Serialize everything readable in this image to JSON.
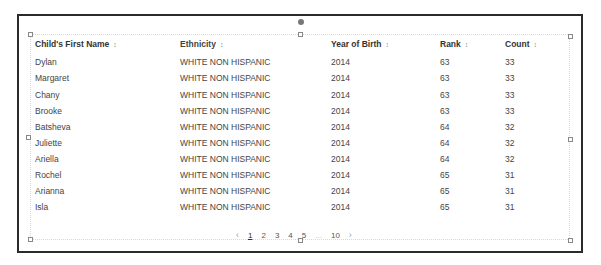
{
  "table": {
    "columns": [
      {
        "label": "Child's First Name",
        "sort_icon": "sort-icon"
      },
      {
        "label": "Ethnicity",
        "sort_icon": "sort-icon"
      },
      {
        "label": "Year of Birth",
        "sort_icon": "sort-icon"
      },
      {
        "label": "Rank",
        "sort_icon": "sort-icon"
      },
      {
        "label": "Count",
        "sort_icon": "sort-icon"
      }
    ],
    "sort_glyph": "↕",
    "rows": [
      [
        "Dylan",
        "WHITE NON HISPANIC",
        "2014",
        "63",
        "33"
      ],
      [
        "Margaret",
        "WHITE NON HISPANIC",
        "2014",
        "63",
        "33"
      ],
      [
        "Chany",
        "WHITE NON HISPANIC",
        "2014",
        "63",
        "33"
      ],
      [
        "Brooke",
        "WHITE NON HISPANIC",
        "2014",
        "63",
        "33"
      ],
      [
        "Batsheva",
        "WHITE NON HISPANIC",
        "2014",
        "64",
        "32"
      ],
      [
        "Juliette",
        "WHITE NON HISPANIC",
        "2014",
        "64",
        "32"
      ],
      [
        "Ariella",
        "WHITE NON HISPANIC",
        "2014",
        "64",
        "32"
      ],
      [
        "Rochel",
        "WHITE NON HISPANIC",
        "2014",
        "65",
        "31"
      ],
      [
        "Arianna",
        "WHITE NON HISPANIC",
        "2014",
        "65",
        "31"
      ],
      [
        "Isla",
        "WHITE NON HISPANIC",
        "2014",
        "65",
        "31"
      ]
    ]
  },
  "pagination": {
    "prev": "‹",
    "pages": [
      "1",
      "2",
      "3",
      "4",
      "5"
    ],
    "ellipsis": "...",
    "last": "10",
    "next": "›",
    "current": "1"
  }
}
